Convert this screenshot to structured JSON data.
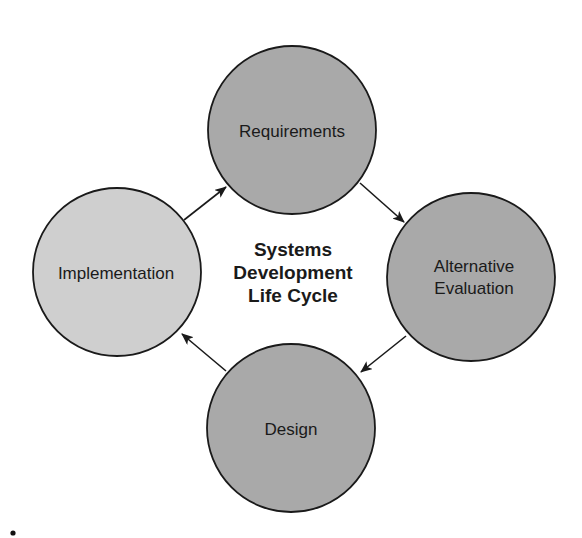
{
  "diagram": {
    "title_lines": [
      "Systems",
      "Development",
      "Life Cycle"
    ],
    "colors": {
      "dark_node_fill": "#a9a9a9",
      "light_node_fill": "#cfcfcf",
      "stroke": "#1a1a1a",
      "background": "#ffffff"
    },
    "nodes": [
      {
        "id": "requirements",
        "lines": [
          "Requirements"
        ],
        "shade": "dark"
      },
      {
        "id": "alternative-evaluation",
        "lines": [
          "Alternative",
          "Evaluation"
        ],
        "shade": "dark"
      },
      {
        "id": "design",
        "lines": [
          "Design"
        ],
        "shade": "dark"
      },
      {
        "id": "implementation",
        "lines": [
          "Implementation"
        ],
        "shade": "light"
      }
    ],
    "edges": [
      {
        "from": "requirements",
        "to": "alternative-evaluation"
      },
      {
        "from": "alternative-evaluation",
        "to": "design"
      },
      {
        "from": "design",
        "to": "implementation"
      },
      {
        "from": "implementation",
        "to": "requirements"
      }
    ],
    "bullet": "•"
  }
}
